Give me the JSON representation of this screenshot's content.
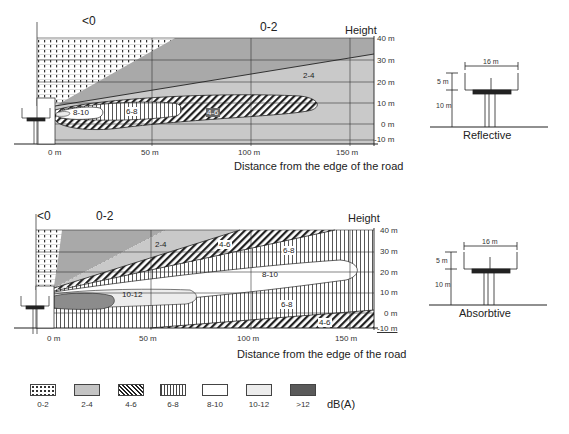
{
  "panels": [
    {
      "id": "reflective",
      "top_labels": {
        "left": "<0",
        "center": "0-2",
        "height": "Height"
      },
      "y_ticks": [
        "40 m",
        "30 m",
        "20 m",
        "10 m",
        "0 m",
        "-10 m"
      ],
      "x_ticks": [
        "0 m",
        "50 m",
        "100 m",
        "150 m"
      ],
      "x_title": "Distance from the edge of the road",
      "zone_labels": [
        "2-4",
        "4-6",
        "6-8",
        "8-10"
      ],
      "barrier": {
        "width": "16 m",
        "upper": "5 m",
        "lower": "10 m",
        "caption": "Reflective"
      }
    },
    {
      "id": "absorbtive",
      "top_labels": {
        "left": "<0",
        "center": "0-2",
        "height": "Height"
      },
      "y_ticks": [
        "40 m",
        "30 m",
        "20 m",
        "10 m",
        "0 m",
        "-10 m"
      ],
      "x_ticks": [
        "0 m",
        "50 m",
        "100 m",
        "150 m"
      ],
      "x_title": "Distance from the edge of the road",
      "zone_labels": [
        "2-4",
        "4-6",
        "6-8",
        "8-10",
        "10-12",
        "6-8",
        "4-6"
      ],
      "barrier": {
        "width": "16 m",
        "upper": "5 m",
        "lower": "10 m",
        "caption": "Absorbtive"
      }
    }
  ],
  "legend": {
    "items": [
      {
        "label": "0-2",
        "pattern": "dotted-grid"
      },
      {
        "label": "2-4",
        "pattern": "light-gray"
      },
      {
        "label": "4-6",
        "pattern": "diagonal-hatch"
      },
      {
        "label": "6-8",
        "pattern": "vertical-lines"
      },
      {
        "label": "8-10",
        "pattern": "white"
      },
      {
        "label": "10-12",
        "pattern": "very-light-gray"
      },
      {
        "label": ">12",
        "pattern": "dark-gray"
      }
    ],
    "unit": "dB(A)"
  },
  "colors": {
    "zone_0_2_bg": "#ffffff",
    "zone_2_4": "#c9c9c9",
    "zone_0_2_dark": "#a9a9a9",
    "zone_10_12": "#ececec",
    "zone_gt12": "#5a5a5a",
    "line": "#222222"
  }
}
